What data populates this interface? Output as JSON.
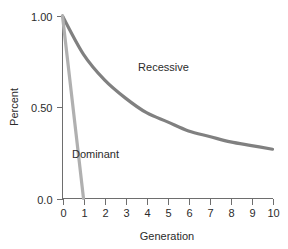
{
  "chart_data": {
    "type": "line",
    "title": "",
    "xlabel": "Generation",
    "ylabel": "Percent",
    "xlim": [
      0,
      10
    ],
    "ylim": [
      0.0,
      1.0
    ],
    "grid": false,
    "legend_position": "inline-annotation",
    "x_ticks": [
      "0",
      "1",
      "2",
      "3",
      "4",
      "5",
      "6",
      "7",
      "8",
      "9",
      "10"
    ],
    "x_tick_values": [
      0,
      1,
      2,
      3,
      4,
      5,
      6,
      7,
      8,
      9,
      10
    ],
    "y_ticks": [
      "0.0",
      "0.50",
      "1.00"
    ],
    "y_tick_values": [
      0.0,
      0.5,
      1.0
    ],
    "x": [
      0,
      1,
      2,
      3,
      4,
      5,
      6,
      7,
      8,
      9,
      10
    ],
    "series": [
      {
        "name": "Recessive",
        "color": "#808080",
        "stroke_width": 3.2,
        "values": [
          1.0,
          0.79,
          0.65,
          0.55,
          0.47,
          0.42,
          0.37,
          0.34,
          0.31,
          0.29,
          0.27
        ]
      },
      {
        "name": "Dominant",
        "color": "#b0b0b0",
        "stroke_width": 3.2,
        "values": [
          1.0,
          0.0,
          null,
          null,
          null,
          null,
          null,
          null,
          null,
          null,
          null
        ]
      }
    ],
    "annotations": [
      {
        "text": "Recessive",
        "x": 3.6,
        "y": 0.7
      },
      {
        "text": "Dominant",
        "x": 0.45,
        "y": 0.22
      }
    ]
  },
  "axes": {
    "y_title": "Percent",
    "x_title": "Generation"
  }
}
